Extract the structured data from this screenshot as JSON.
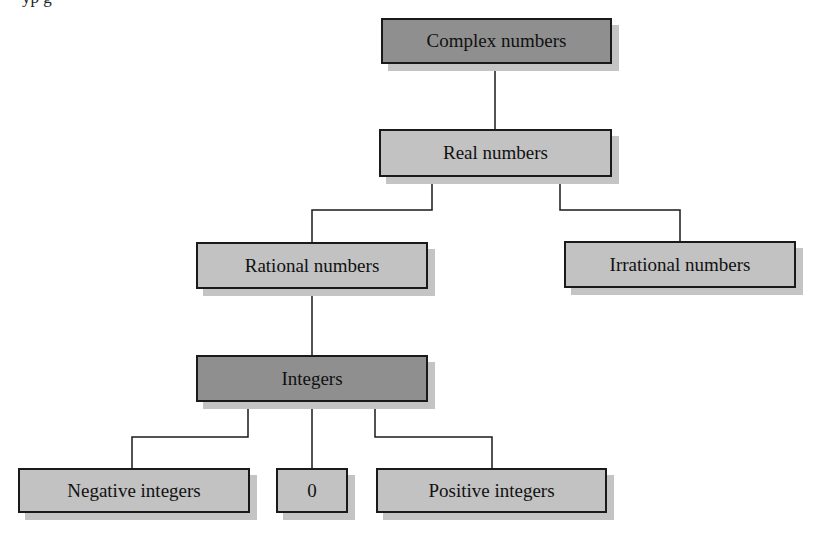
{
  "partial_caption": "yp                                          g",
  "diagram": {
    "type": "tree",
    "nodes": [
      {
        "id": "complex",
        "label": "Complex numbers",
        "shade": "dark"
      },
      {
        "id": "real",
        "label": "Real numbers",
        "shade": "light"
      },
      {
        "id": "rational",
        "label": "Rational numbers",
        "shade": "light"
      },
      {
        "id": "irrational",
        "label": "Irrational numbers",
        "shade": "light"
      },
      {
        "id": "integers",
        "label": "Integers",
        "shade": "dark"
      },
      {
        "id": "negative",
        "label": "Negative integers",
        "shade": "light"
      },
      {
        "id": "zero",
        "label": "0",
        "shade": "light"
      },
      {
        "id": "positive",
        "label": "Positive integers",
        "shade": "light"
      }
    ],
    "edges": [
      [
        "complex",
        "real"
      ],
      [
        "real",
        "rational"
      ],
      [
        "real",
        "irrational"
      ],
      [
        "rational",
        "integers"
      ],
      [
        "integers",
        "negative"
      ],
      [
        "integers",
        "zero"
      ],
      [
        "integers",
        "positive"
      ]
    ],
    "colors": {
      "dark": "#8f8f8f",
      "light": "#c2c2c2",
      "border": "#1a1a1a",
      "shadow": "#c4c4c4"
    }
  }
}
